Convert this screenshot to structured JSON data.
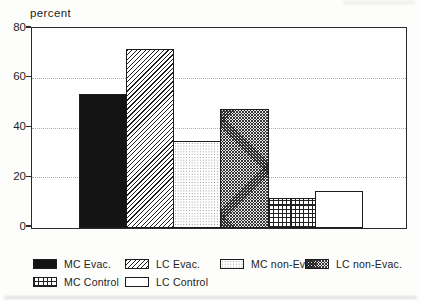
{
  "figure": {
    "y_axis_title": "percent"
  },
  "chart_data": {
    "type": "bar",
    "title": "",
    "xlabel": "",
    "ylabel": "percent",
    "ylim": [
      0,
      80
    ],
    "yticks": [
      0,
      20,
      40,
      60,
      80
    ],
    "grid": "horizontal dotted gridlines at 20, 40, 60; solid frame around plot",
    "legend_position": "bottom",
    "categories": [
      "MC Evac.",
      "LC Evac.",
      "MC non-Evac.",
      "LC non-Evac.",
      "MC Control",
      "LC Control"
    ],
    "values": [
      54,
      72,
      35,
      48,
      12,
      15
    ],
    "patterns": [
      "solid-black",
      "diagonal-hatch",
      "light-dots",
      "dense-mesh",
      "grid-check",
      "white"
    ]
  },
  "legend": {
    "rows": [
      [
        {
          "label": "MC Evac.",
          "pattern": "solid-black"
        },
        {
          "label": "LC Evac.",
          "pattern": "diagonal-hatch"
        },
        {
          "label": "MC non-Evac.",
          "pattern": "light-dots"
        },
        {
          "label": "LC non-Evac.",
          "pattern": "dense-mesh"
        }
      ],
      [
        {
          "label": "MC Control",
          "pattern": "grid-check"
        },
        {
          "label": "LC Control",
          "pattern": "white"
        }
      ]
    ]
  },
  "colors": {
    "ink": "#1c1c1c",
    "paper": "#fdfdfc",
    "grid_line": "#ababab"
  }
}
